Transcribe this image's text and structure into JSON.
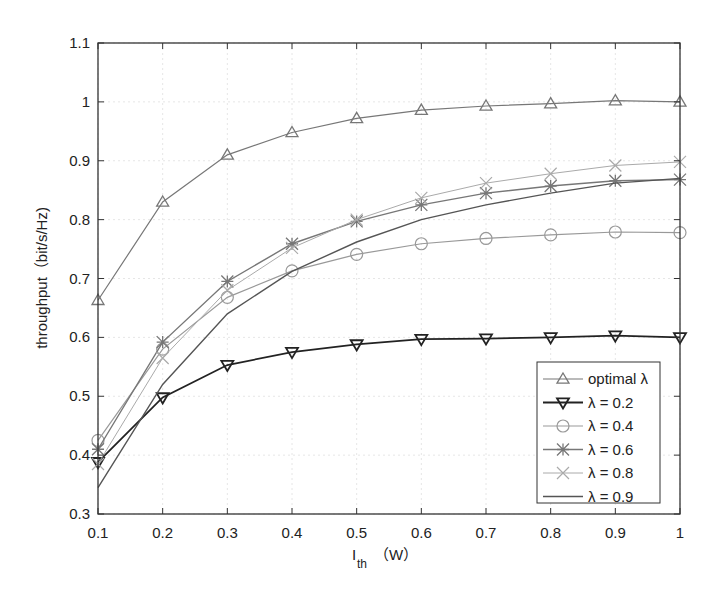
{
  "chart_data": {
    "type": "line",
    "title": "",
    "xlabel": "I_th (W)",
    "xlabel_main": "I",
    "xlabel_sub": "th",
    "xlabel_unit": "（W）",
    "ylabel": "throughput（bit/s/Hz)",
    "xlim": [
      0.1,
      1.0
    ],
    "ylim": [
      0.3,
      1.1
    ],
    "x": [
      0.1,
      0.2,
      0.3,
      0.4,
      0.5,
      0.6,
      0.7,
      0.8,
      0.9,
      1.0
    ],
    "xticks": [
      "0.1",
      "0.2",
      "0.3",
      "0.4",
      "0.5",
      "0.6",
      "0.7",
      "0.8",
      "0.9",
      "1"
    ],
    "yticks": [
      "0.3",
      "0.4",
      "0.5",
      "0.6",
      "0.7",
      "0.8",
      "0.9",
      "1",
      "1.1"
    ],
    "grid": true,
    "legend_position": "lower right",
    "series": [
      {
        "name": "optimal λ",
        "marker": "triangle-up",
        "color": "#777777",
        "width": 1.2,
        "values": [
          0.663,
          0.83,
          0.91,
          0.948,
          0.972,
          0.986,
          0.993,
          0.997,
          1.002,
          1.0
        ]
      },
      {
        "name": "λ = 0.2",
        "marker": "triangle-down",
        "color": "#222222",
        "width": 1.8,
        "values": [
          0.388,
          0.498,
          0.553,
          0.575,
          0.588,
          0.597,
          0.598,
          0.6,
          0.603,
          0.6
        ]
      },
      {
        "name": "λ = 0.4",
        "marker": "circle",
        "color": "#999999",
        "width": 1.2,
        "values": [
          0.425,
          0.58,
          0.668,
          0.713,
          0.741,
          0.759,
          0.768,
          0.774,
          0.779,
          0.778
        ]
      },
      {
        "name": "λ = 0.6",
        "marker": "star",
        "color": "#777777",
        "width": 1.4,
        "values": [
          0.41,
          0.592,
          0.695,
          0.759,
          0.797,
          0.825,
          0.845,
          0.857,
          0.866,
          0.868
        ]
      },
      {
        "name": "λ = 0.8",
        "marker": "x",
        "color": "#aaaaaa",
        "width": 1.0,
        "values": [
          0.385,
          0.565,
          0.68,
          0.752,
          0.8,
          0.837,
          0.862,
          0.878,
          0.892,
          0.898
        ]
      },
      {
        "name": "λ = 0.9",
        "marker": "none",
        "color": "#555555",
        "width": 1.4,
        "values": [
          0.345,
          0.52,
          0.64,
          0.712,
          0.762,
          0.8,
          0.825,
          0.845,
          0.862,
          0.87
        ]
      }
    ]
  }
}
